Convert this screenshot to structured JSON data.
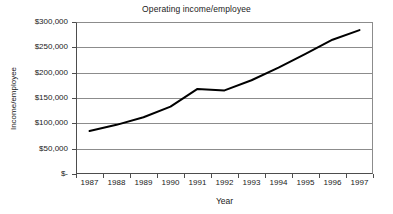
{
  "chart_data": {
    "type": "line",
    "title": "Operating income/employee",
    "xlabel": "Year",
    "ylabel": "Income/employee",
    "categories": [
      "1987",
      "1988",
      "1989",
      "1990",
      "1991",
      "1992",
      "1993",
      "1994",
      "1995",
      "1996",
      "1997"
    ],
    "series": [
      {
        "name": "Operating income/employee",
        "values": [
          85000,
          97000,
          112000,
          133000,
          168000,
          165000,
          185000,
          210000,
          237000,
          265000,
          284000
        ]
      }
    ],
    "ylim": [
      0,
      300000
    ],
    "y_ticks": [
      0,
      50000,
      100000,
      150000,
      200000,
      250000,
      300000
    ],
    "y_tick_labels": [
      "$-",
      "$50,000",
      "$100,000",
      "$150,000",
      "$200,000",
      "$250,000",
      "$300,000"
    ],
    "x_tick_labels": [
      "1987",
      "1988",
      "1989",
      "1990",
      "1991",
      "1992",
      "1993",
      "1994",
      "1995",
      "1996",
      "1997"
    ],
    "grid": true,
    "legend": false,
    "legend_position": "none",
    "line_color": "#000000",
    "gridline_color": "#8c8c8c",
    "axis_color": "#4d4d4d",
    "background_color": "#ffffff"
  }
}
